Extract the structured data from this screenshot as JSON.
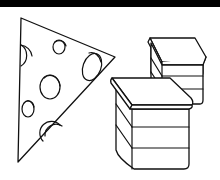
{
  "illustration": {
    "subjects": [
      "cheese-wedge",
      "small-stacked-box",
      "large-stacked-box"
    ],
    "colors": {
      "stroke": "#111111",
      "fill": "#ffffff",
      "top_bar": "#000000"
    }
  }
}
